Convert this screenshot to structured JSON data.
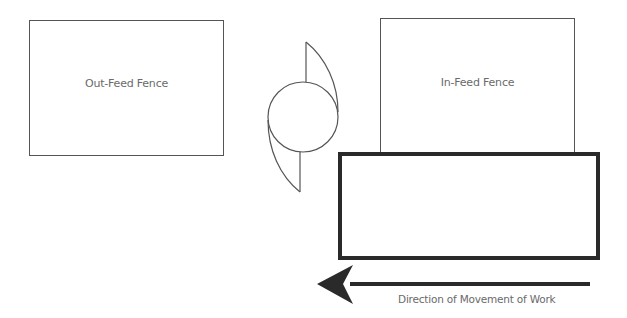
{
  "diagram": {
    "outfeed_fence": {
      "label": "Out-Feed Fence"
    },
    "infeed_fence": {
      "label": "In-Feed Fence"
    },
    "cutter_head": {
      "label": ""
    },
    "workpiece": {
      "label": ""
    },
    "direction": {
      "label": "Direction of Movement of Work"
    }
  },
  "colors": {
    "line": "#555555",
    "work_border": "#2a2a2a",
    "text": "#6a6a6a",
    "arrow": "#2a2a2a"
  }
}
